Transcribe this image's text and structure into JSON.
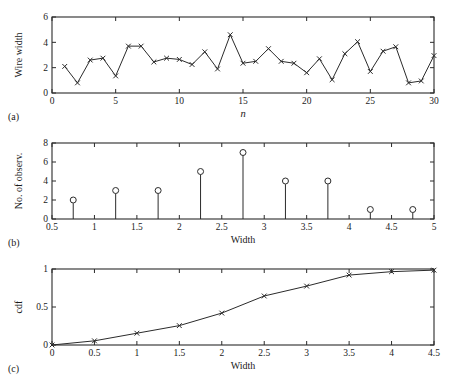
{
  "figure": {
    "panel_a_tag": "(a)",
    "panel_b_tag": "(b)",
    "panel_c_tag": "(c)"
  },
  "chart_data": [
    {
      "type": "line",
      "panel": "a",
      "title": "",
      "xlabel": "n",
      "ylabel": "Wire width",
      "xlim": [
        0,
        30
      ],
      "ylim": [
        0,
        6
      ],
      "xticks": [
        0,
        5,
        10,
        15,
        20,
        25,
        30
      ],
      "xticklabels": [
        "0",
        "5",
        "10",
        "15",
        "20",
        "25",
        "30"
      ],
      "yticks": [
        0,
        2,
        4,
        6
      ],
      "yticklabels": [
        "0",
        "2",
        "4",
        "6"
      ],
      "grid": false,
      "marker": "x",
      "x": [
        1,
        2,
        3,
        4,
        5,
        6,
        7,
        8,
        9,
        10,
        11,
        12,
        13,
        14,
        15,
        16,
        17,
        18,
        19,
        20,
        21,
        22,
        23,
        24,
        25,
        26,
        27,
        28,
        29,
        30
      ],
      "values": [
        2.1,
        0.8,
        2.6,
        2.75,
        1.35,
        3.7,
        3.7,
        2.45,
        2.75,
        2.65,
        2.25,
        3.25,
        1.9,
        4.6,
        2.35,
        2.5,
        3.5,
        2.5,
        2.35,
        1.6,
        2.7,
        1.05,
        3.1,
        4.05,
        1.7,
        3.3,
        3.65,
        0.8,
        0.95,
        2.95
      ]
    },
    {
      "type": "bar",
      "panel": "b",
      "title": "",
      "xlabel": "Width",
      "ylabel": "No. of observ.",
      "xlim": [
        0.5,
        5
      ],
      "ylim": [
        0,
        8
      ],
      "xticks": [
        0.5,
        1,
        1.5,
        2,
        2.5,
        3,
        3.5,
        4,
        4.5,
        5
      ],
      "xticklabels": [
        "0.5",
        "1",
        "1.5",
        "2",
        "2.5",
        "3",
        "3.5",
        "4",
        "4.5",
        "5"
      ],
      "yticks": [
        0,
        2,
        4,
        6,
        8
      ],
      "yticklabels": [
        "0",
        "2",
        "4",
        "6",
        "8"
      ],
      "grid": false,
      "marker": "circle",
      "categories": [
        0.75,
        1.25,
        1.75,
        2.25,
        2.75,
        3.25,
        3.75,
        4.25,
        4.75
      ],
      "values": [
        2,
        3,
        3,
        5,
        7,
        4,
        4,
        1,
        1
      ]
    },
    {
      "type": "line",
      "panel": "c",
      "title": "",
      "xlabel": "Width",
      "ylabel": "cdf",
      "xlim": [
        0,
        4.5
      ],
      "ylim": [
        0,
        1
      ],
      "xticks": [
        0,
        0.5,
        1,
        1.5,
        2,
        2.5,
        3,
        3.5,
        4,
        4.5
      ],
      "xticklabels": [
        "0",
        "0.5",
        "1",
        "1.5",
        "2",
        "2.5",
        "3",
        "3.5",
        "4",
        "4.5"
      ],
      "yticks": [
        0,
        0.5,
        1
      ],
      "yticklabels": [
        "0",
        "0.5",
        "1"
      ],
      "grid": false,
      "marker": "x",
      "x": [
        0,
        0.5,
        1,
        1.5,
        2,
        2.5,
        3,
        3.5,
        4,
        4.5
      ],
      "values": [
        0,
        0.055,
        0.155,
        0.255,
        0.42,
        0.645,
        0.775,
        0.92,
        0.965,
        0.985
      ]
    }
  ]
}
